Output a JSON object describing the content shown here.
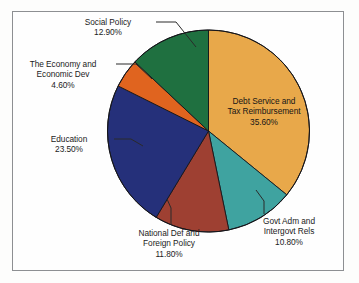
{
  "chart_data": {
    "type": "pie",
    "title": "",
    "subtitle": "",
    "xlabel": "",
    "ylabel": "",
    "legend_position": "none",
    "grid": false,
    "value_unit": "percent",
    "start_angle_deg": 0,
    "direction": "clockwise",
    "categories": [
      "Debt Service and Tax Reimbursement",
      "Govt Adm and Intergovt Rels",
      "National Def and Foreign Policy",
      "Education",
      "The Economy and Economic Dev",
      "Social Policy"
    ],
    "values": [
      35.6,
      10.8,
      11.8,
      23.5,
      4.6,
      12.9
    ],
    "colors": [
      "#e8a84a",
      "#3fa3a0",
      "#9e4032",
      "#25307a",
      "#e0641f",
      "#1f7040"
    ],
    "slices": [
      {
        "name": "debt-service",
        "label_lines": [
          "Debt Service and",
          "Tax Reimbursement"
        ],
        "value": 35.6,
        "value_text": "35.60%",
        "color": "#e8a84a",
        "label_placement": "inside"
      },
      {
        "name": "govt-adm",
        "label_lines": [
          "Govt Adm and",
          "Intergovt Rels"
        ],
        "value": 10.8,
        "value_text": "10.80%",
        "color": "#3fa3a0",
        "label_placement": "outside"
      },
      {
        "name": "national-defense",
        "label_lines": [
          "National Def and",
          "Foreign Policy"
        ],
        "value": 11.8,
        "value_text": "11.80%",
        "color": "#9e4032",
        "label_placement": "outside"
      },
      {
        "name": "education",
        "label_lines": [
          "Education"
        ],
        "value": 23.5,
        "value_text": "23.50%",
        "color": "#25307a",
        "label_placement": "outside"
      },
      {
        "name": "economy",
        "label_lines": [
          "The Economy and",
          "Economic Dev"
        ],
        "value": 4.6,
        "value_text": "4.60%",
        "color": "#e0641f",
        "label_placement": "outside"
      },
      {
        "name": "social-policy",
        "label_lines": [
          "Social Policy"
        ],
        "value": 12.9,
        "value_text": "12.90%",
        "color": "#1f7040",
        "label_placement": "outside"
      }
    ]
  },
  "figure": {
    "border_color": "#8d8f92",
    "background": "#fefefe"
  }
}
